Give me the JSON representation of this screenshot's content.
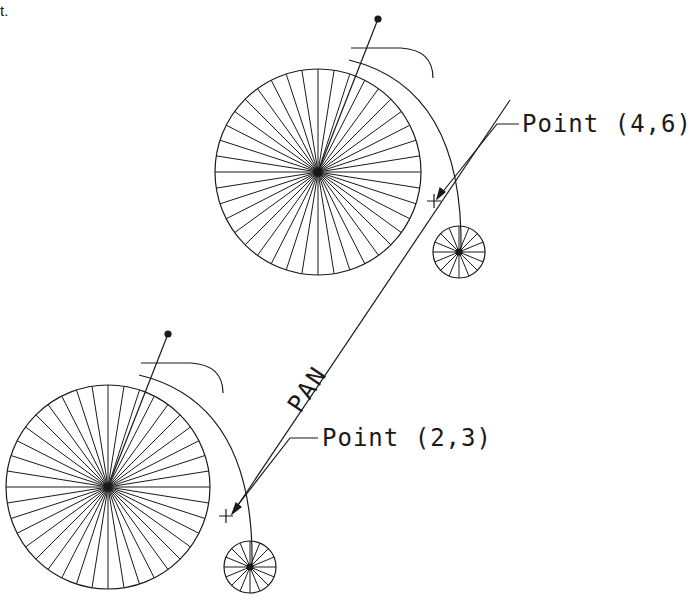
{
  "corner_fragment": "t.",
  "labels": {
    "point_a": "Point (4,6)",
    "point_b": "Point (2,3)",
    "pan": "PAN"
  },
  "colors": {
    "ink": "#1a1a1a",
    "background": "#ffffff"
  },
  "figure": {
    "bicycles": [
      {
        "name": "upper",
        "big_wheel": {
          "cx": 318,
          "cy": 172,
          "r": 103,
          "spokes": 40
        },
        "small_wheel": {
          "cx": 459,
          "cy": 252,
          "r": 26,
          "spokes": 16
        }
      },
      {
        "name": "lower",
        "big_wheel": {
          "cx": 108,
          "cy": 487,
          "r": 102,
          "spokes": 40
        },
        "small_wheel": {
          "cx": 250,
          "cy": 567,
          "r": 26,
          "spokes": 16
        }
      }
    ],
    "pan_vector": {
      "from": "Point (2,3)",
      "to": "Point (4,6)"
    }
  }
}
